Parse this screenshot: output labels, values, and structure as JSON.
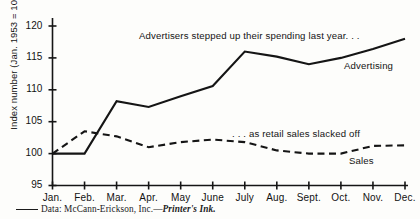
{
  "chart_data": {
    "type": "line",
    "title": "",
    "xlabel": "",
    "ylabel": "Index number (Jan. 1953 = 100)",
    "categories": [
      "Jan.",
      "Feb.",
      "Mar.",
      "Apr.",
      "May",
      "June",
      "July",
      "Aug.",
      "Sept.",
      "Oct.",
      "Nov.",
      "Dec."
    ],
    "ylim": [
      95,
      120
    ],
    "yticks": [
      95,
      100,
      105,
      110,
      115,
      120
    ],
    "grid": false,
    "legend": "inline-series-labels",
    "series": [
      {
        "name": "Advertising",
        "style": "solid",
        "values": [
          100,
          100,
          108.2,
          107.3,
          109.0,
          110.6,
          116.0,
          115.2,
          114.0,
          115.0,
          116.4,
          118.0
        ]
      },
      {
        "name": "Sales",
        "style": "dashed",
        "values": [
          100,
          103.5,
          102.7,
          101.0,
          101.8,
          102.2,
          101.8,
          100.5,
          100.0,
          100.0,
          101.2,
          101.3
        ]
      }
    ],
    "annotations": [
      "Advertisers stepped up their spending last year. . .",
      ". . . as retail sales slacked off"
    ],
    "source_note": "Data: McCann-Erickson, Inc.—Printer's Ink.",
    "source_prefix": "Data: McCann-Erickson, Inc.—",
    "source_italic": "Printer's Ink.",
    "colors": {
      "line": "#151515",
      "axis": "#151515",
      "background": "#fdfdfb"
    }
  }
}
